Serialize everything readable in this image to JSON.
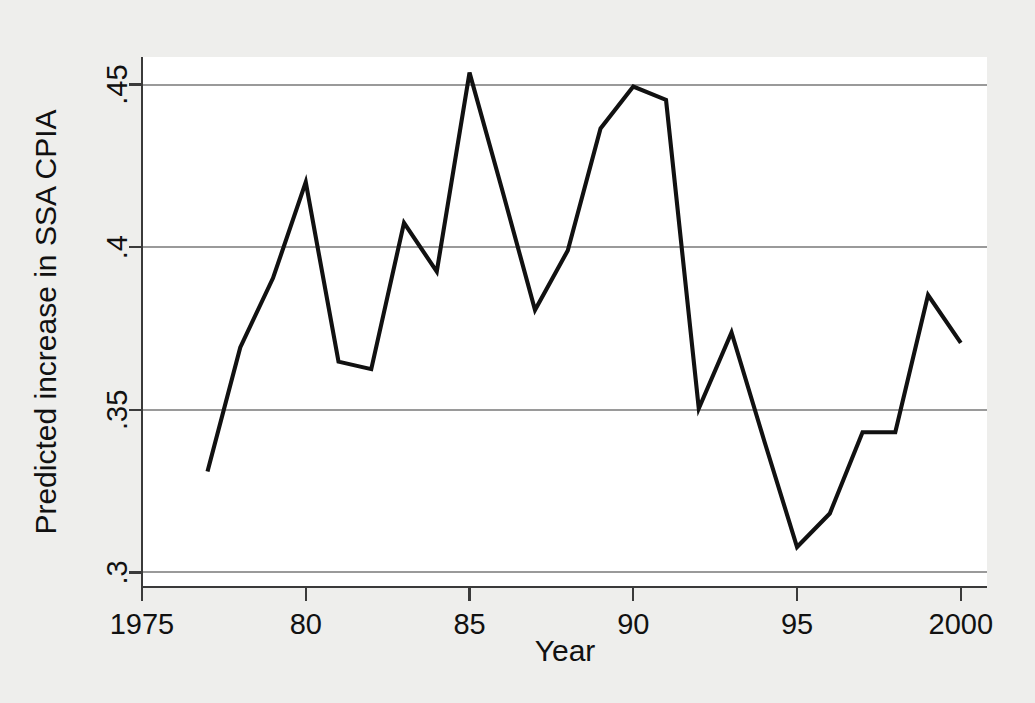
{
  "chart_data": {
    "type": "line",
    "title": "",
    "subtitle": "",
    "xlabel": "Year",
    "ylabel": "Predicted increase in SSA CPIA",
    "xlim": [
      1975.0,
      2000.8
    ],
    "ylim": [
      0.2955,
      0.4585
    ],
    "grid": "horizontal",
    "legend": "none",
    "x_ticks": [
      1975,
      1980,
      1985,
      1990,
      1995,
      2000
    ],
    "x_tick_labels": [
      "1975",
      "80",
      "85",
      "90",
      "95",
      "2000"
    ],
    "y_ticks": [
      0.3,
      0.35,
      0.4,
      0.45
    ],
    "y_tick_labels": [
      ".3",
      ".35",
      ".4",
      ".45"
    ],
    "series": [
      {
        "name": "Predicted increase in SSA CPIA",
        "color": "#111111",
        "x": [
          1977,
          1978,
          1979,
          1980,
          1981,
          1982,
          1983,
          1984,
          1985,
          1986,
          1987,
          1988,
          1989,
          1990,
          1991,
          1992,
          1993,
          1994,
          1995,
          1996,
          1997,
          1998,
          1999,
          2000
        ],
        "values": [
          0.331,
          0.3692,
          0.3905,
          0.42,
          0.3648,
          0.3625,
          0.4075,
          0.3925,
          0.4537,
          0.4175,
          0.3807,
          0.399,
          0.4365,
          0.4494,
          0.4453,
          0.3504,
          0.3738,
          0.3404,
          0.3078,
          0.3181,
          0.3431,
          0.3431,
          0.3853,
          0.3706
        ]
      }
    ],
    "colors": {
      "line": "#111111",
      "gridline": "#9a9a9a",
      "axis": "#3a3a3a",
      "plot_background": "#ffffff",
      "figure_background": "#eeeeec",
      "text": "#111111"
    }
  }
}
